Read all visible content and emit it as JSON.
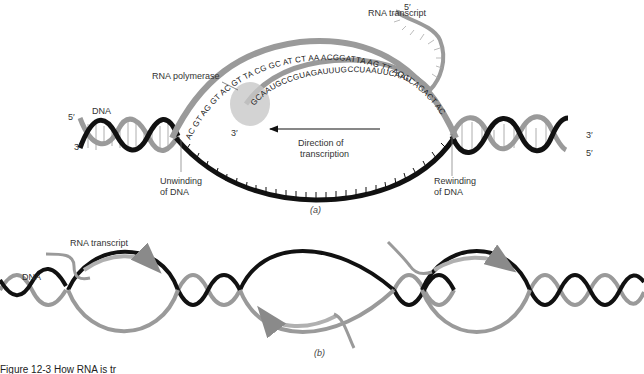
{
  "panel_a": {
    "caption": "(a)",
    "labels": {
      "rna_transcript": "RNA transcript",
      "rna_polymerase": "RNA polymerase",
      "dna": "DNA",
      "left_5prime": "5′",
      "left_3prime": "3′",
      "right_3prime": "3′",
      "right_5prime": "5′",
      "transcript_5prime": "5′",
      "rna_3prime": "3′",
      "direction_line1": "Direction of",
      "direction_line2": "transcription",
      "unwinding_line1": "Unwinding",
      "unwinding_line2": "of DNA",
      "rewinding_line1": "Rewinding",
      "rewinding_line2": "of DNA"
    },
    "sequences": {
      "dna_template": "AC GT AG GT AC GT TA CG GC AT CT AA ACGGATTA AG TT AGGCAGACT AC",
      "rna": "GCAAUGCCGUAGAUUUGCCUAAUUCAAU"
    }
  },
  "panel_b": {
    "caption": "(b)",
    "labels": {
      "rna_transcript": "RNA transcript",
      "dna": "DNA"
    }
  },
  "figure_caption": "Figure 12-3  How RNA is tr",
  "colors": {
    "dark_strand": "#111111",
    "light_strand": "#9a9a9a",
    "polymerase": "#c8c8c8",
    "background": "#ffffff"
  }
}
